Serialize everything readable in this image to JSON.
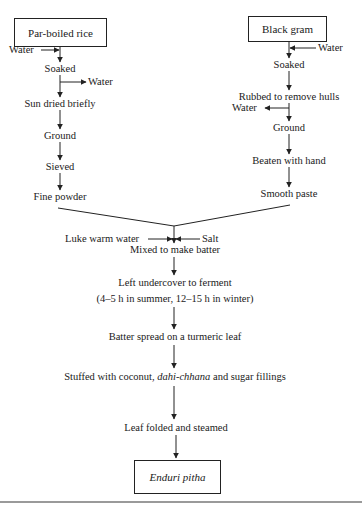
{
  "diagram": {
    "type": "process-flowchart",
    "left_branch": {
      "start": "Par-boiled rice",
      "input_water": "Water",
      "steps": [
        "Soaked",
        "Sun dried briefly",
        "Ground",
        "Sieved",
        "Fine powder"
      ],
      "output_water": "Water"
    },
    "right_branch": {
      "start": "Black gram",
      "input_water": "Water",
      "steps": [
        "Soaked",
        "Rubbed to remove hulls",
        "Ground",
        "Beaten with hand",
        "Smooth paste"
      ],
      "output_water": "Water"
    },
    "merge": {
      "input_left": "Luke warm water",
      "input_right": "Salt",
      "step": "Mixed to make batter"
    },
    "main_steps": {
      "ferment": "Left undercover to ferment",
      "ferment_note": "(4–5 h in summer, 12–15 h in winter)",
      "spread": "Batter spread on a turmeric leaf",
      "stuffed_pre": "Stuffed with coconut, ",
      "stuffed_italic": "dahi-chhana",
      "stuffed_post": " and sugar fillings",
      "fold": "Leaf folded and steamed"
    },
    "end": "Enduri pitha",
    "colors": {
      "line": "#222222",
      "text": "#1a1a1a",
      "rule": "#9a9a9a"
    }
  }
}
